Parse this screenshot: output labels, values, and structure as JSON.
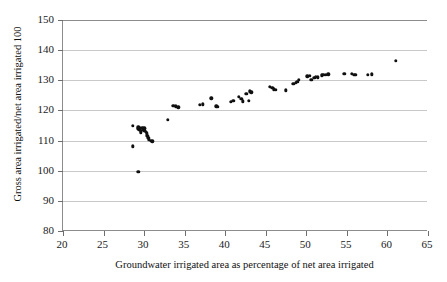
{
  "chart_data": {
    "type": "scatter",
    "title": "",
    "xlabel": "Groundwater irrigated area as percentage of net area irrigated",
    "ylabel": "Gross area irrigated/net area irrigated 100",
    "xlim": [
      20,
      65
    ],
    "ylim": [
      80,
      150
    ],
    "xticks": [
      20,
      25,
      30,
      35,
      40,
      45,
      50,
      55,
      60,
      65
    ],
    "yticks": [
      80,
      90,
      100,
      110,
      120,
      130,
      140,
      150
    ],
    "grid": "horizontal",
    "legend": "none",
    "marker": "filled-circle",
    "marker_color": "#101010",
    "points": [
      [
        28.6,
        114.8
      ],
      [
        28.6,
        108.1
      ],
      [
        29.2,
        113.9
      ],
      [
        29.3,
        114.4
      ],
      [
        29.4,
        113.5
      ],
      [
        29.5,
        114.2
      ],
      [
        29.6,
        113.2
      ],
      [
        29.6,
        112.7
      ],
      [
        29.8,
        114.3
      ],
      [
        29.9,
        113.8
      ],
      [
        30.0,
        114.1
      ],
      [
        30.0,
        113.3
      ],
      [
        30.1,
        114.0
      ],
      [
        30.2,
        113.0
      ],
      [
        30.3,
        112.4
      ],
      [
        30.4,
        111.6
      ],
      [
        30.5,
        111.0
      ],
      [
        30.6,
        110.4
      ],
      [
        30.8,
        109.9
      ],
      [
        31.0,
        109.8
      ],
      [
        29.3,
        99.6
      ],
      [
        32.9,
        116.9
      ],
      [
        33.6,
        121.6
      ],
      [
        33.9,
        121.4
      ],
      [
        34.2,
        121.1
      ],
      [
        36.9,
        121.8
      ],
      [
        37.2,
        122.0
      ],
      [
        38.3,
        124.0
      ],
      [
        38.9,
        121.4
      ],
      [
        39.1,
        121.2
      ],
      [
        40.7,
        122.9
      ],
      [
        41.0,
        123.1
      ],
      [
        41.7,
        124.6
      ],
      [
        42.0,
        123.8
      ],
      [
        42.2,
        123.0
      ],
      [
        42.6,
        125.6
      ],
      [
        42.9,
        123.2
      ],
      [
        43.0,
        126.3
      ],
      [
        43.2,
        126.0
      ],
      [
        45.5,
        127.8
      ],
      [
        45.8,
        127.6
      ],
      [
        46.0,
        127.0
      ],
      [
        46.2,
        126.9
      ],
      [
        47.5,
        126.7
      ],
      [
        48.4,
        128.8
      ],
      [
        48.7,
        129.2
      ],
      [
        48.9,
        129.5
      ],
      [
        49.1,
        130.2
      ],
      [
        50.1,
        131.3
      ],
      [
        50.4,
        131.5
      ],
      [
        50.6,
        130.2
      ],
      [
        51.0,
        130.9
      ],
      [
        51.2,
        131.2
      ],
      [
        51.4,
        131.0
      ],
      [
        51.9,
        131.6
      ],
      [
        52.1,
        131.8
      ],
      [
        52.4,
        131.9
      ],
      [
        52.7,
        132.0
      ],
      [
        54.7,
        132.1
      ],
      [
        55.6,
        132.1
      ],
      [
        55.9,
        131.9
      ],
      [
        56.1,
        131.8
      ],
      [
        57.6,
        131.9
      ],
      [
        58.1,
        132.0
      ],
      [
        61.0,
        136.4
      ]
    ]
  }
}
